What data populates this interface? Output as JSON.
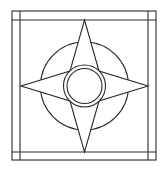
{
  "diagram": {
    "title": "",
    "stroke_color": "#2a2a2a",
    "background_color": "#ffffff",
    "outer_square": {
      "x1": 12,
      "y1": 11,
      "x2": 156,
      "y2": 160
    },
    "border_lines": {
      "vertical": [
        20,
        148
      ],
      "horizontal": [
        20,
        152
      ]
    },
    "center": {
      "x": 84.5,
      "y": 86
    },
    "big_circle_radius": 44,
    "ring_outer_radius": 21,
    "ring_inner_radius": 17.5,
    "star": {
      "top": [
        84.5,
        20
      ],
      "right": [
        148,
        86
      ],
      "bottom": [
        84.5,
        152
      ],
      "left": [
        21,
        86
      ],
      "waist": [
        [
          70,
          71
        ],
        [
          99,
          71
        ],
        [
          99,
          101
        ],
        [
          70,
          101
        ]
      ]
    }
  }
}
